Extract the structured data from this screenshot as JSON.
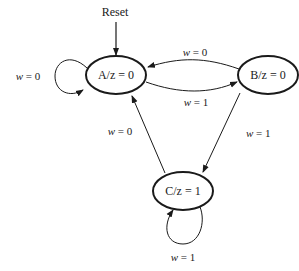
{
  "diagram": {
    "type": "finite-state-machine (Moore)",
    "reset_label": "Reset",
    "states": [
      {
        "id": "A",
        "label": "A/z = 0",
        "output": "z = 0"
      },
      {
        "id": "B",
        "label": "B/z = 0",
        "output": "z = 0"
      },
      {
        "id": "C",
        "label": "C/z = 1",
        "output": "z = 1"
      }
    ],
    "transitions": [
      {
        "from": "A",
        "to": "A",
        "var": "w",
        "rest": " = 0"
      },
      {
        "from": "B",
        "to": "A",
        "var": "w",
        "rest": " = 0"
      },
      {
        "from": "A",
        "to": "B",
        "var": "w",
        "rest": " = 1"
      },
      {
        "from": "B",
        "to": "C",
        "var": "w",
        "rest": " = 1"
      },
      {
        "from": "C",
        "to": "A",
        "var": "w",
        "rest": " = 0"
      },
      {
        "from": "C",
        "to": "C",
        "var": "w",
        "rest": " = 1"
      }
    ],
    "colors": {
      "stroke": "#1a1a1a",
      "background": "#ffffff"
    }
  }
}
